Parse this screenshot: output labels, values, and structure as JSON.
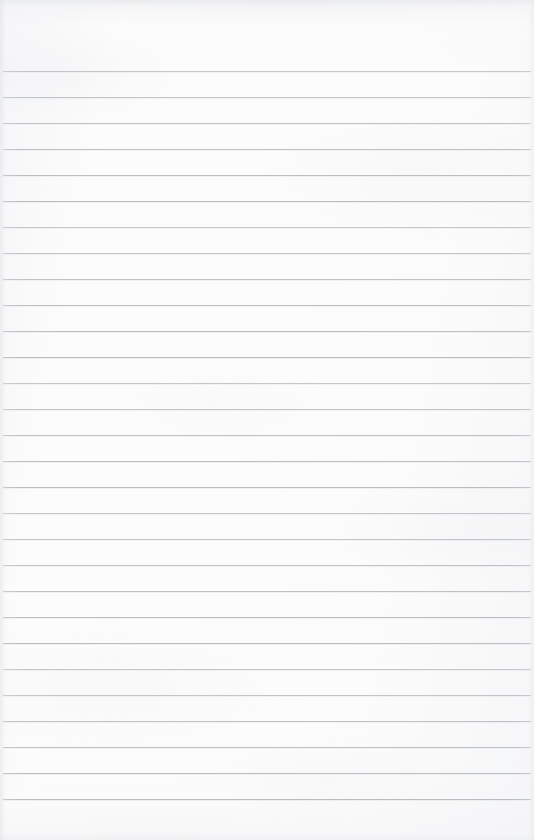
{
  "document": {
    "kind": "scanned-blank-ruled-paper",
    "title": "Blank ruled notebook page",
    "orientation": "portrait",
    "page_width_px": 534,
    "page_height_px": 840,
    "written_content": "",
    "has_handwriting": false,
    "has_printed_text": false,
    "has_margin_rule": false,
    "has_holes": false
  },
  "appearance": {
    "paper_color": "#fcfcfc",
    "rule_line_color": "#b7babf",
    "rule_line_echo_color": "#e3e5e8",
    "edge_shadow_color": "#e1e2e5",
    "rule_line_thickness_px": 1
  },
  "ruling": {
    "line_count": 29,
    "first_line_y": 71,
    "line_spacing_px": 26.0,
    "top_margin_px": 71,
    "bottom_margin_px": 22,
    "line_start_x": 3,
    "line_end_x": 531,
    "line_y_positions": [
      71,
      97,
      123,
      149,
      175,
      201,
      227,
      253,
      279,
      305,
      331,
      357,
      383,
      409,
      435,
      461,
      487,
      513,
      539,
      565,
      591,
      617,
      643,
      669,
      695,
      721,
      747,
      773,
      799
    ]
  }
}
